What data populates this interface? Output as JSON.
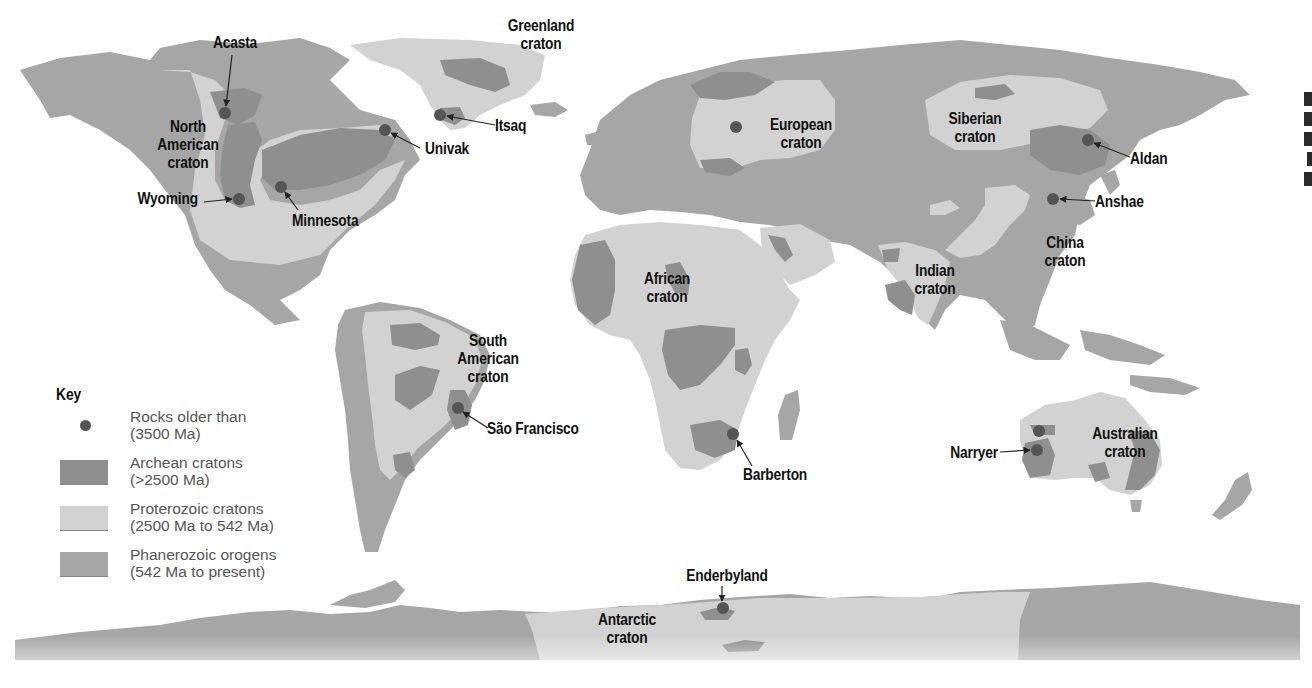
{
  "colors": {
    "ocean": "#ffffff",
    "phanerozoic": "#a6a6a6",
    "proterozoic": "#d2d2d2",
    "archean": "#8f8f8f",
    "old_rock_dot": "#555555",
    "label_text": "#111111",
    "legend_text": "#555555"
  },
  "legend": {
    "title": "Key",
    "items": [
      {
        "id": "old-rocks",
        "symbol": "dot",
        "line1": "Rocks older than",
        "line2": "(3500 Ma)",
        "color": "#555555"
      },
      {
        "id": "archean",
        "symbol": "swatch",
        "line1": "Archean cratons",
        "line2": "(>2500 Ma)",
        "color": "#8f8f8f"
      },
      {
        "id": "proterozoic",
        "symbol": "swatch",
        "line1": "Proterozoic cratons",
        "line2": "(2500 Ma to 542 Ma)",
        "color": "#d2d2d2"
      },
      {
        "id": "phanerozoic",
        "symbol": "swatch",
        "line1": "Phanerozoic orogens",
        "line2": "(542 Ma to present)",
        "color": "#a6a6a6"
      }
    ]
  },
  "cratons": [
    {
      "id": "north-american",
      "line1": "North",
      "line2": "American",
      "line3": "craton"
    },
    {
      "id": "greenland",
      "line1": "Greenland",
      "line2": "craton"
    },
    {
      "id": "european",
      "line1": "European",
      "line2": "craton"
    },
    {
      "id": "siberian",
      "line1": "Siberian",
      "line2": "craton"
    },
    {
      "id": "china",
      "line1": "China",
      "line2": "craton"
    },
    {
      "id": "indian",
      "line1": "Indian",
      "line2": "craton"
    },
    {
      "id": "african",
      "line1": "African",
      "line2": "craton"
    },
    {
      "id": "south-american",
      "line1": "South",
      "line2": "American",
      "line3": "craton"
    },
    {
      "id": "australian",
      "line1": "Australian",
      "line2": "craton"
    },
    {
      "id": "antarctic",
      "line1": "Antarctic",
      "line2": "craton"
    }
  ],
  "sites": [
    {
      "id": "acasta",
      "name": "Acasta"
    },
    {
      "id": "wyoming",
      "name": "Wyoming"
    },
    {
      "id": "minnesota",
      "name": "Minnesota"
    },
    {
      "id": "univak",
      "name": "Univak"
    },
    {
      "id": "itsaq",
      "name": "Itsaq"
    },
    {
      "id": "aldan",
      "name": "Aldan"
    },
    {
      "id": "anshae",
      "name": "Anshae"
    },
    {
      "id": "sao-francisco",
      "name": "São Francisco"
    },
    {
      "id": "barberton",
      "name": "Barberton"
    },
    {
      "id": "narryer",
      "name": "Narryer"
    },
    {
      "id": "enderbyland",
      "name": "Enderbyland"
    }
  ]
}
